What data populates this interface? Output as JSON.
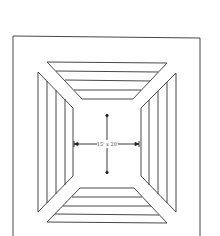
{
  "diagram": {
    "type": "ceiling-diffuser-plan",
    "dimension_label": "15' x 20'",
    "colors": {
      "line": "#333333",
      "background": "#ffffff"
    },
    "outer_frame": {
      "x": 13,
      "y": 36,
      "w": 187,
      "h": 210
    },
    "panels": {
      "top": {
        "outer": [
          [
            47,
            62
          ],
          [
            167,
            62
          ]
        ],
        "inner": [
          [
            82,
            99
          ],
          [
            133,
            99
          ]
        ],
        "louvers_y": [
          71,
          80,
          90
        ]
      },
      "bottom": {
        "outer": [
          [
            47,
            223
          ],
          [
            167,
            223
          ]
        ],
        "inner": [
          [
            80,
            188
          ],
          [
            134,
            188
          ]
        ],
        "louvers_y": [
          197,
          206,
          214
        ]
      },
      "left": {
        "outer": [
          [
            38,
            72
          ],
          [
            38,
            212
          ]
        ],
        "inner": [
          [
            73,
            108
          ],
          [
            73,
            176
          ]
        ],
        "louvers_x": [
          47,
          56,
          65
        ]
      },
      "right": {
        "outer": [
          [
            176,
            73
          ],
          [
            176,
            212
          ]
        ],
        "inner": [
          [
            141,
            108
          ],
          [
            141,
            176
          ]
        ],
        "louvers_x": [
          150,
          159,
          168
        ]
      }
    },
    "arrows": {
      "horizontal": {
        "x1": 74,
        "x2": 139,
        "y": 144
      },
      "vertical": {
        "x": 107,
        "y1": 115,
        "y2": 173
      }
    }
  }
}
